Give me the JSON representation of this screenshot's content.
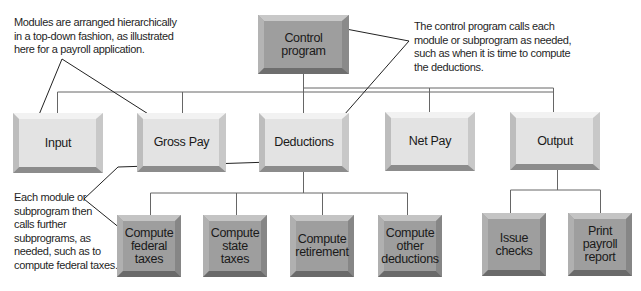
{
  "diagram": {
    "type": "hierarchy-chart",
    "root": {
      "label": "Control\nprogram",
      "style": "dark",
      "children": [
        {
          "label": "Input",
          "style": "light",
          "children": []
        },
        {
          "label": "Gross Pay",
          "style": "light",
          "children": []
        },
        {
          "label": "Deductions",
          "style": "light",
          "children": [
            {
              "label": "Compute\nfederal\ntaxes",
              "style": "dark"
            },
            {
              "label": "Compute\nstate\ntaxes",
              "style": "dark"
            },
            {
              "label": "Compute\nretirement",
              "style": "dark"
            },
            {
              "label": "Compute\nother\ndeductions",
              "style": "dark"
            }
          ]
        },
        {
          "label": "Net Pay",
          "style": "light",
          "children": []
        },
        {
          "label": "Output",
          "style": "light",
          "children": [
            {
              "label": "Issue\nchecks",
              "style": "dark"
            },
            {
              "label": "Print\npayroll\nreport",
              "style": "dark"
            }
          ]
        }
      ]
    },
    "annotations": {
      "top_left": "Modules are arranged hierarchically\nin a top-down fashion, as illustrated\nhere for a payroll application.",
      "top_right": "The control program calls each\nmodule or subprogram as needed,\nsuch as when it is time to compute\nthe deductions.",
      "bottom_left": "Each module or\nsubprogram then\ncalls further\nsubprograms, as\nneeded, such as to\ncompute federal taxes."
    },
    "colors": {
      "light_box": "#e3e3e3",
      "dark_box": "#9e9e9e",
      "connector": "#555555",
      "callout_line": "#222222"
    }
  }
}
